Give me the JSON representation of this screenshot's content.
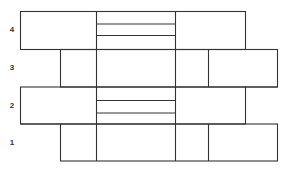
{
  "diagram": {
    "title": "",
    "type": "stacked-course-layout",
    "line_color": "#333333",
    "rows": [
      {
        "label": "4",
        "label_y": 30
      },
      {
        "label": "3",
        "label_y": 68
      },
      {
        "label": "2",
        "label_y": 106
      },
      {
        "label": "1",
        "label_y": 143
      }
    ]
  }
}
